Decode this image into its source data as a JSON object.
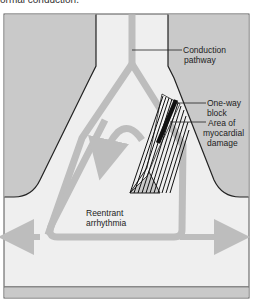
{
  "caption": "ormal conduction.",
  "labels": {
    "conduction_pathway": [
      "Conduction",
      "pathway"
    ],
    "one_way_block": [
      "One-way",
      "block"
    ],
    "myocardial_damage": [
      "Area of",
      "myocardial",
      "damage"
    ],
    "reentrant": [
      "Reentrant",
      "arrhythmia"
    ]
  },
  "colors": {
    "tissue_gray": "#c9c9c9",
    "chamber_light": "#efefef",
    "pathway_gray": "#bdbdbd",
    "outline": "#222222",
    "block_black": "#111111"
  }
}
